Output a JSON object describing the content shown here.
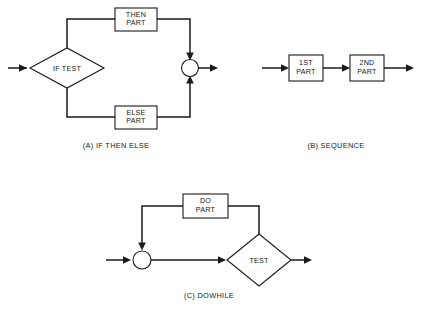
{
  "figure": {
    "background_color": "#ffffff",
    "line_color": "#1a1a1a",
    "shape_fill": "#ffffff"
  },
  "diagram_a": {
    "caption": "(A) IF THEN ELSE",
    "decision": {
      "line1": "IF TEST"
    },
    "then_box": {
      "line1": "THEN",
      "line2": "PART"
    },
    "else_box": {
      "line1": "ELSE",
      "line2": "PART"
    },
    "junction": "merge-node"
  },
  "diagram_b": {
    "caption": "(B) SEQUENCE",
    "first_box": {
      "line1": "1ST",
      "line2": "PART"
    },
    "second_box": {
      "line1": "2ND",
      "line2": "PART"
    }
  },
  "diagram_c": {
    "caption": "(C) DOWHILE",
    "do_box": {
      "line1": "DO",
      "line2": "PART"
    },
    "decision": {
      "line1": "TEST"
    },
    "junction": "merge-node"
  }
}
